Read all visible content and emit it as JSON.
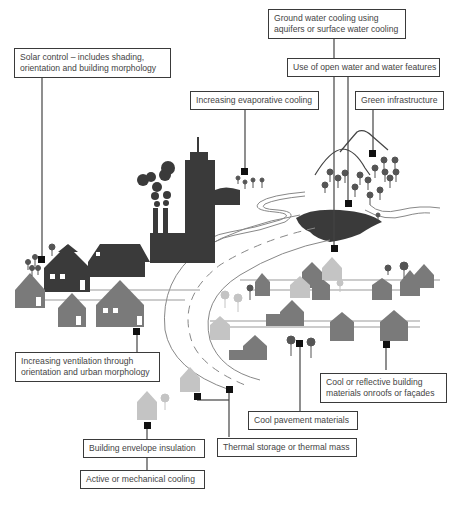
{
  "diagram": {
    "colors": {
      "dark": "#3a3a3a",
      "mid": "#7a7a7a",
      "light": "#c4c4c4",
      "line": "#555555",
      "road": "#888888"
    },
    "labels": [
      {
        "id": "solar-control",
        "line1": "Solar control – includes shading,",
        "line2": "orientation and building morphology"
      },
      {
        "id": "ground-water",
        "line1": "Ground water cooling using",
        "line2": "aquifers or surface water cooling"
      },
      {
        "id": "open-water",
        "line1": "Use of open water and water features"
      },
      {
        "id": "evaporative",
        "line1": "Increasing evaporative cooling"
      },
      {
        "id": "green-infra",
        "line1": "Green infrastructure"
      },
      {
        "id": "ventilation",
        "line1": "Increasing ventilation through",
        "line2": "orientation and urban morphology"
      },
      {
        "id": "cool-reflective",
        "line1": "Cool or reflective building",
        "line2": "materials onroofs or façades"
      },
      {
        "id": "cool-pavement",
        "line1": "Cool pavement materials"
      },
      {
        "id": "thermal-storage",
        "line1": "Thermal storage or thermal mass"
      },
      {
        "id": "envelope",
        "line1": "Building envelope insulation"
      },
      {
        "id": "active-cooling",
        "line1": "Active or mechanical cooling"
      }
    ]
  }
}
